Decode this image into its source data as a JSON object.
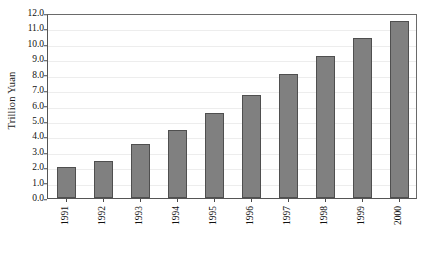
{
  "chart_data": {
    "type": "bar",
    "title": "",
    "subtitle": "",
    "xlabel": "",
    "ylabel": "Trillion Yuan",
    "categories": [
      "1991",
      "1992",
      "1993",
      "1994",
      "1995",
      "1996",
      "1997",
      "1998",
      "1999",
      "2000"
    ],
    "values": [
      2.0,
      2.4,
      3.5,
      4.4,
      5.5,
      6.7,
      8.05,
      9.2,
      10.4,
      11.5
    ],
    "ylim": [
      0.0,
      12.0
    ],
    "ytick_step": 1.0,
    "ytick_labels": [
      "0.0",
      "1.0",
      "2.0",
      "3.0",
      "4.0",
      "5.0",
      "6.0",
      "7.0",
      "8.0",
      "9.0",
      "10.0",
      "11.0",
      "12.0"
    ],
    "ytick_values": [
      0,
      1,
      2,
      3,
      4,
      5,
      6,
      7,
      8,
      9,
      10,
      11,
      12
    ],
    "grid": true,
    "grid_axis": "y",
    "legend": false,
    "legend_position": "none",
    "xtick_rotation": -90,
    "bar_color": "#808080",
    "bar_border_color": "#4f4f4f",
    "gridline_color": "#ededed",
    "axis_color": "#555555",
    "background_color": "#ffffff"
  }
}
